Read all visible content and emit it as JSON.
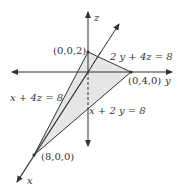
{
  "diagram": {
    "type": "3d-plane-intercepts",
    "axes": {
      "x": "x",
      "y": "y",
      "z": "z"
    },
    "points": {
      "z_intercept": "(0,0,2)",
      "y_intercept": "(0,4,0)",
      "x_intercept": "(8,0,0)"
    },
    "traces": {
      "yz": "2 y + 4z = 8",
      "xz": "x  + 4z = 8",
      "xy": "x + 2 y  = 8"
    },
    "colors": {
      "line": "#333333",
      "fill": "#e6e6e6"
    }
  }
}
